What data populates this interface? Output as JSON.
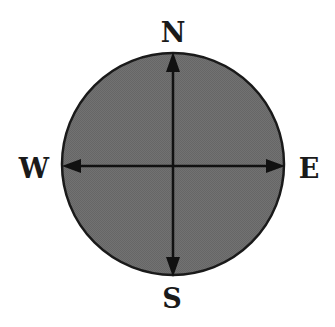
{
  "diagram": {
    "type": "compass-rose",
    "labels": {
      "north": "N",
      "south": "S",
      "west": "W",
      "east": "E"
    },
    "colors": {
      "disc_fill": "#6e6e6e",
      "outline": "#1a1a1a",
      "arrow": "#111111",
      "background": "#ffffff"
    }
  }
}
